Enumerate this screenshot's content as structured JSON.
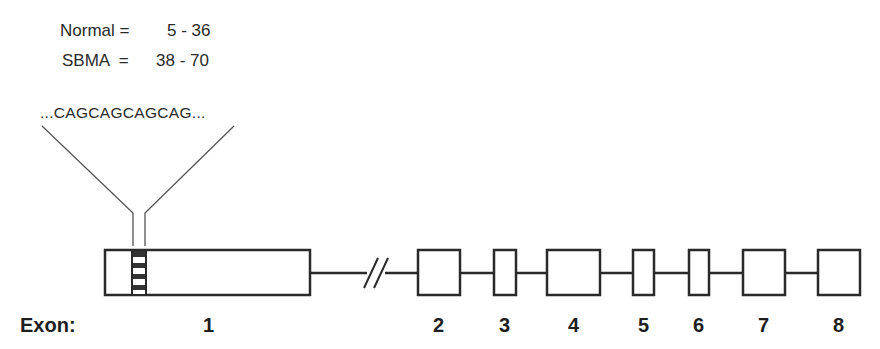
{
  "repeat_ranges": {
    "normal_label": "Normal =",
    "normal_value": "5 - 36",
    "sbma_label": "SBMA  =",
    "sbma_value": "38 - 70"
  },
  "sequence": "...CAGCAGCAGCAG...",
  "exon_axis_label": "Exon:",
  "exons": [
    {
      "label": "1",
      "x": 105,
      "w": 205
    },
    {
      "label": "2",
      "x": 418,
      "w": 42
    },
    {
      "label": "3",
      "x": 494,
      "w": 22
    },
    {
      "label": "4",
      "x": 547,
      "w": 53
    },
    {
      "label": "5",
      "x": 633,
      "w": 21
    },
    {
      "label": "6",
      "x": 689,
      "w": 20
    },
    {
      "label": "7",
      "x": 743,
      "w": 42
    },
    {
      "label": "8",
      "x": 818,
      "w": 42
    }
  ],
  "colors": {
    "stroke": "#2a2a2a",
    "text": "#222222"
  }
}
